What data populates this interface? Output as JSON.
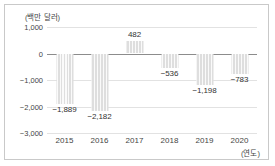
{
  "chart_data": {
    "type": "bar",
    "title": "",
    "unit_caption": "(백만 달러)",
    "xlabel": "(연도)",
    "ylabel": "",
    "categories": [
      "2015",
      "2016",
      "2017",
      "2018",
      "2019",
      "2020"
    ],
    "values": [
      -1889,
      -2182,
      482,
      -536,
      -1198,
      -783
    ],
    "value_labels": [
      "−1,889",
      "−2,182",
      "482",
      "−536",
      "−1,198",
      "−783"
    ],
    "ylim": [
      -3000,
      1000
    ],
    "yticks": [
      1000,
      0,
      -1000,
      -2000,
      -3000
    ],
    "ytick_labels": [
      "1,000",
      "0",
      "−1,000",
      "−2,000",
      "−3,000"
    ],
    "grid": true,
    "legend": "none",
    "series_name": "",
    "bar_color": "#dedede",
    "zero_line_color": "#8c8c8c",
    "grid_color": "#e2e2e2",
    "text_color": "#444444",
    "frame_color": "#c9c9c9"
  }
}
